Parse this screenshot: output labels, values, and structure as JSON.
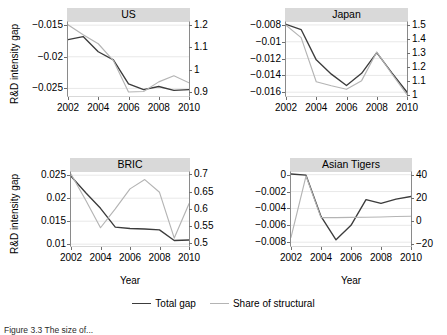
{
  "figure": {
    "caption": "Figure 3.3 The size of...",
    "axis_title_y": "R&D intensity gap",
    "axis_title_x": "Year"
  },
  "legend": {
    "position": "bottom-center",
    "entries": [
      {
        "label": "Total gap",
        "color": "#3c3c3c"
      },
      {
        "label": "Share of structural",
        "color": "#b4b4b4"
      }
    ]
  },
  "chart_data": [
    {
      "type": "line",
      "title": "US",
      "xlabel": "Year",
      "ylabel": "R&D intensity gap",
      "x": [
        2002,
        2003,
        2004,
        2005,
        2006,
        2007,
        2008,
        2009,
        2010
      ],
      "xticks": [
        "2002",
        "2004",
        "2006",
        "2008",
        "2010"
      ],
      "xlim": [
        2002,
        2010
      ],
      "ylim": [
        -0.0262,
        -0.0145
      ],
      "yticks": [
        "-0.015",
        "-0.02",
        "-0.025"
      ],
      "ytickvals": [
        -0.015,
        -0.02,
        -0.025
      ],
      "y2lim": [
        0.882,
        1.212
      ],
      "y2ticks": [
        "1.2",
        "1.1",
        "1",
        "0.9"
      ],
      "y2tickvals": [
        1.2,
        1.1,
        1.0,
        0.9
      ],
      "grid": true,
      "series": [
        {
          "name": "Total gap",
          "axis": "left",
          "color": "#3c3c3c",
          "values": [
            -0.0173,
            -0.0168,
            -0.0192,
            -0.0205,
            -0.0243,
            -0.0252,
            -0.0247,
            -0.0253,
            -0.0252
          ]
        },
        {
          "name": "Share of structural",
          "axis": "right",
          "color": "#b4b4b4",
          "values": [
            1.2,
            1.155,
            1.115,
            1.04,
            0.9,
            0.902,
            0.945,
            0.972,
            0.941
          ]
        }
      ]
    },
    {
      "type": "line",
      "title": "Japan",
      "xlabel": "Year",
      "ylabel": "R&D intensity gap",
      "x": [
        2002,
        2003,
        2004,
        2005,
        2006,
        2007,
        2008,
        2009,
        2010
      ],
      "xticks": [
        "2002",
        "2004",
        "2006",
        "2008",
        "2010"
      ],
      "xlim": [
        2002,
        2010
      ],
      "ylim": [
        -0.01645,
        -0.00765
      ],
      "yticks": [
        "-0.008",
        "-0.01",
        "-0.012",
        "-0.014",
        "-0.016"
      ],
      "ytickvals": [
        -0.008,
        -0.01,
        -0.012,
        -0.014,
        -0.016
      ],
      "y2lim": [
        0.99,
        1.52
      ],
      "y2ticks": [
        "1.5",
        "1.4",
        "1.3",
        "1.2",
        "1.1",
        "1"
      ],
      "y2tickvals": [
        1.5,
        1.4,
        1.3,
        1.2,
        1.1,
        1.0
      ],
      "grid": true,
      "series": [
        {
          "name": "Total gap",
          "axis": "left",
          "color": "#3c3c3c",
          "values": [
            -0.00792,
            -0.00855,
            -0.01215,
            -0.01385,
            -0.0152,
            -0.01375,
            -0.01128,
            -0.0137,
            -0.016
          ]
        },
        {
          "name": "Share of structural",
          "axis": "right",
          "color": "#b4b4b4",
          "values": [
            1.497,
            1.408,
            1.092,
            1.063,
            1.038,
            1.1,
            1.305,
            1.148,
            1.0
          ]
        }
      ]
    },
    {
      "type": "line",
      "title": "BRIC",
      "xlabel": "Year",
      "ylabel": "R&D intensity gap",
      "x": [
        2002,
        2003,
        2004,
        2005,
        2006,
        2007,
        2008,
        2009,
        2010
      ],
      "xticks": [
        "2002",
        "2004",
        "2006",
        "2008",
        "2010"
      ],
      "xlim": [
        2002,
        2010
      ],
      "ylim": [
        0.0096,
        0.0257
      ],
      "yticks": [
        "0.025",
        "0.02",
        "0.015",
        "0.01"
      ],
      "ytickvals": [
        0.025,
        0.02,
        0.015,
        0.01
      ],
      "y2lim": [
        0.492,
        0.707
      ],
      "y2ticks": [
        "0.7",
        "0.65",
        "0.6",
        "0.55",
        "0.5"
      ],
      "y2tickvals": [
        0.7,
        0.65,
        0.6,
        0.55,
        0.5
      ],
      "grid": true,
      "series": [
        {
          "name": "Total gap",
          "axis": "left",
          "color": "#3c3c3c",
          "values": [
            0.0248,
            0.0212,
            0.0178,
            0.0137,
            0.0134,
            0.0133,
            0.0131,
            0.0108,
            0.0109
          ]
        },
        {
          "name": "Share of structural",
          "axis": "right",
          "color": "#b4b4b4",
          "values": [
            0.701,
            0.625,
            0.545,
            0.6,
            0.658,
            0.685,
            0.648,
            0.515,
            0.615
          ]
        }
      ]
    },
    {
      "type": "line",
      "title": "Asian Tigers",
      "xlabel": "Year",
      "ylabel": "R&D intensity gap",
      "x": [
        2002,
        2003,
        2004,
        2005,
        2006,
        2007,
        2008,
        2009,
        2010
      ],
      "xticks": [
        "2002",
        "2004",
        "2006",
        "2008",
        "2010"
      ],
      "xlim": [
        2002,
        2010
      ],
      "ylim": [
        -0.00845,
        0.00032
      ],
      "yticks": [
        "0",
        "-0.002",
        "-0.004",
        "-0.006",
        "-0.008"
      ],
      "ytickvals": [
        0,
        -0.002,
        -0.004,
        -0.006,
        -0.008
      ],
      "y2lim": [
        -21.5,
        42.5
      ],
      "y2ticks": [
        "40",
        "20",
        "0",
        "-20"
      ],
      "y2tickvals": [
        40,
        20,
        0,
        -20
      ],
      "grid": true,
      "series": [
        {
          "name": "Total gap",
          "axis": "left",
          "color": "#3c3c3c",
          "values": [
            8e-05,
            -5e-05,
            -0.00495,
            -0.00772,
            -0.006,
            -0.00295,
            -0.0034,
            -0.0029,
            -0.00258
          ]
        },
        {
          "name": "Share of structural",
          "axis": "right",
          "color": "#b4b4b4",
          "values": [
            -14.0,
            39.0,
            3.0,
            3.0,
            3.2,
            3.4,
            3.6,
            4.0,
            4.2
          ]
        }
      ]
    }
  ]
}
